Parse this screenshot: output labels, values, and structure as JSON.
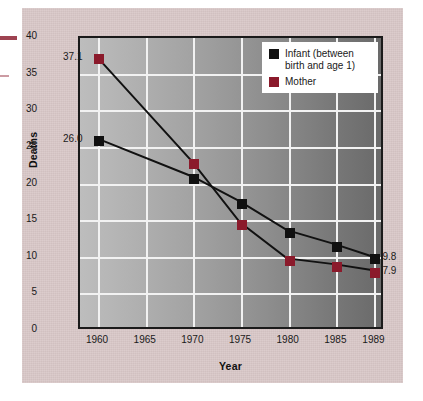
{
  "chart_data": {
    "type": "line",
    "title": "",
    "xlabel": "Year",
    "ylabel": "Deaths",
    "x": [
      1960,
      1970,
      1975,
      1980,
      1985,
      1989
    ],
    "xticks": [
      "1960",
      "1965",
      "1970",
      "1975",
      "1980",
      "1985",
      "1989"
    ],
    "xtick_values": [
      1960,
      1965,
      1970,
      1975,
      1980,
      1985,
      1989
    ],
    "yticks": [
      "0",
      "5",
      "10",
      "15",
      "20",
      "25",
      "30",
      "35",
      "40"
    ],
    "ytick_values": [
      0,
      5,
      10,
      15,
      20,
      25,
      30,
      35,
      40
    ],
    "xlim": [
      1958,
      1990
    ],
    "ylim": [
      0,
      40
    ],
    "grid": true,
    "legend_position": "top-right",
    "series": [
      {
        "name": "Infant (between birth and age 1)",
        "short_name": "Infant",
        "color": "#101010",
        "marker": "square",
        "values": [
          26.0,
          20.8,
          17.4,
          13.4,
          11.5,
          9.8
        ]
      },
      {
        "name": "Mother",
        "short_name": "Mother",
        "color": "#8b1a2b",
        "marker": "square",
        "values": [
          37.1,
          22.8,
          14.5,
          9.5,
          8.7,
          7.9
        ]
      }
    ],
    "annotations": [
      {
        "text": "37.1",
        "series": "Mother",
        "x": 1960,
        "y": 37.1,
        "anchor": "left"
      },
      {
        "text": "26.0",
        "series": "Infant",
        "x": 1960,
        "y": 26.0,
        "anchor": "left"
      },
      {
        "text": "9.8",
        "series": "Infant",
        "x": 1989,
        "y": 9.8,
        "anchor": "right"
      },
      {
        "text": "7.9",
        "series": "Mother",
        "x": 1989,
        "y": 7.9,
        "anchor": "right"
      }
    ]
  },
  "legend": {
    "entries": [
      {
        "label_line1": "Infant (between",
        "label_line2": "birth and age 1)",
        "color": "#101010"
      },
      {
        "label_line1": "Mother",
        "label_line2": "",
        "color": "#8b1a2b"
      }
    ]
  },
  "colors": {
    "panel_background": "#d9c8c8",
    "plot_gradient_start": "#bdbdbd",
    "plot_gradient_end": "#6a6a6a",
    "gridline": "#f2f2f2",
    "axis_border": "#1a1a1a",
    "infant_series": "#101010",
    "mother_series": "#8b1a2b"
  }
}
